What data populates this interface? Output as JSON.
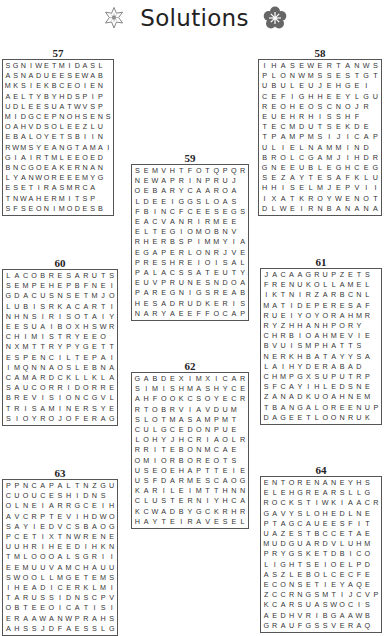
{
  "page": {
    "title": "Solutions",
    "left_icon": "flower-outline-icon",
    "right_icon": "flower-filled-icon",
    "accent": "#555555"
  },
  "puzzles": [
    {
      "number": "57",
      "rows": [
        "SGNIWETMIDASL",
        "ASNADUEESEWAB",
        "MKSIEKBCEOIEN",
        "AELTYBYHDSPIP",
        "UDLEESUATWVSP",
        "MIDGCEPNOHSENS",
        "OAHVDSOLEEZLU",
        "EBALOYETSBIIN",
        "RWMSYEANGTAMAI",
        "GIAIRTMLEEOED",
        "BNCGOEAKERNAN",
        "LYANWOREEEMYG",
        "ESETIRASMRCA",
        "TNWAHERMITSP",
        "SFSEONIMODESB"
      ]
    },
    {
      "number": "58",
      "rows": [
        "IHASEWERTANWS",
        "PLONWMSSESTGT",
        "UBULEUJEHGEI",
        "CEFIGHHEEYLGU",
        "REOHEOSCNOJR",
        "EUEHRHISSHF",
        "TECMDUTSEKDE",
        "TPAMPMSIJICAP",
        "ULIELNAMMIND",
        "BROLCGAMJIHDR",
        "GNEEUBLEGHCEG",
        "SEZAYTESAFKLU",
        "HHISELMJEPVII",
        "IXATKROYWENOT",
        "DLWEIRNBANANA"
      ]
    },
    {
      "number": "59",
      "rows": [
        "SEMVHTFOTQPQR",
        "NEWAPRINPRUJ",
        "OEBARYCAAROA",
        "LDEEIGGSLOAS",
        "FBINCFCEESEGS",
        "EACVANRIRMEE",
        "ELTEGIOMOBNV",
        "RHERBSPIMMYIA",
        "EGAPERLONRJVE",
        "PRESHREIOISAL",
        "PALACSSATEUTY",
        "EUVPRUNESNDOA",
        "PAREGNIGSREAB",
        "HESADRUDKERIS",
        "NARYAEEFFOCAP"
      ]
    },
    {
      "number": "60",
      "rows": [
        "LACOBRESARUTS",
        "SEMPEHEPBFNEI",
        "GDACUSNSETMJO",
        "LUBISRKACARTI",
        "NHNSIRISOTAIY",
        "EESUAIBOXHSWR",
        "CHIMISTRYEEO",
        "NXMTTRYPYGETT",
        "ESPENCILTEPAI",
        "IMQNNAOSLEBNA",
        "CAMARDCKLLKLA",
        "SAUCORRIDORRE",
        "BREVISIONCGVL",
        "TRISAMINERSYE",
        "SIOYROJOFERAG"
      ]
    },
    {
      "number": "61",
      "rows": [
        "JACAAGRUPZETS",
        "FRENUKOLLAMEL",
        "IKTNIRZARBCNL",
        "MATIDEPERESAF",
        "RUEIYOYORAHMR",
        "RYZHHANHPORY",
        "CHRBIOAHMEVIE",
        "BVUISMPHATTS",
        "NERKHBATAYYSA",
        "LAIHYDERABAD",
        "CHMPGXSUPUTRP",
        "SFCAYIHLEDSNE",
        "ZANADKUOAHNEM",
        "TBANGALOREENUP",
        "DAGEETLOONRUK"
      ]
    },
    {
      "number": "62",
      "rows": [
        "GABDEXIMXICAR",
        "SIMISHMASHYCE",
        "AHFOOKCSOYECR",
        "RTOBRVIAVDUM",
        "SLOTMASAMPMT",
        "CULGCEDONPUE",
        "LOHYJHCRIAOLR",
        "RRITEBONMCAE",
        "OMIORBOREOTS",
        "USEOEHAPTTEIE",
        "USFDARMESCAOG",
        "KARILEIMTTHNN",
        "CLUSTERNIYHCA",
        "KCWADBYGCKRHR",
        "HAYTEIRAVESEL"
      ]
    },
    {
      "number": "63",
      "rows": [
        "PPNCAPALTNZGU",
        "CUOUCESHIDNS",
        "OLNEIARRGCEIH",
        "AVCRPTEVIHDWO",
        "SAYIEDVCSBAOG",
        "PCETIXTNWRENE",
        "UUHRIHEEDIHKN",
        "TMLOOOALSGRII",
        "EEMUUVAMCHAUU",
        "SWOOLLMGETEMS",
        "IHEADICERKLMI",
        "TARUSSIDNSCPV",
        "OBTEEOICATISI",
        "ERAAWANWPRAHS",
        "AHSSJDFAESSLG"
      ]
    },
    {
      "number": "64",
      "rows": [
        "ENTORENANEYHS",
        "ELEHGREARSLLG",
        "ROCKSTIWKIAACR",
        "GAVYSLOHEDLNE",
        "PTAGCAUEESFIT",
        "UAZESTBCCETAE",
        "MUDGUARDVLUHM",
        "PRYGSKETDBICO",
        "LIGHTSEIOELPD",
        "ASZLEBOLCECFE",
        "ECONSETIEYAQE",
        "ZCCRNGSMTIJCVP",
        "KCARSUASWOCIS",
        "AEDHVRIBGAAWB",
        "GRAUFGSSVERAQ"
      ]
    }
  ]
}
